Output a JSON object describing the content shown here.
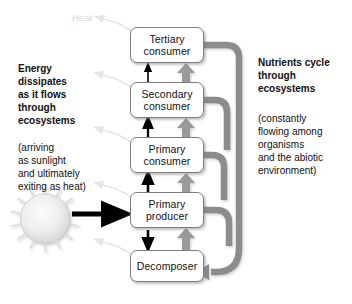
{
  "diagram": {
    "heat_label": "Heat",
    "colors": {
      "energy_arrow": "#000000",
      "nutrient_arrow": "#8c8c8c",
      "nutrient_pipe": "#8c8c8c",
      "heat_arrow": "#e2e2e2",
      "box_border": "#7d7d7d",
      "box_fill": "#ffffff",
      "sun_fill": "#ededed",
      "text": "#111111",
      "heat_label_color": "#d7d7d7"
    },
    "left_column": {
      "heading": "Energy\ndissipates\nas it flows\nthrough\necosystems",
      "note": "(arriving\nas sunlight\nand ultimately\nexiting as heat)"
    },
    "right_column": {
      "heading": "Nutrients cycle\nthrough\necosystems",
      "note": "(constantly\nflowing among\norganisms\nand the abiotic\nenvironment)"
    },
    "boxes": [
      {
        "id": "tertiary",
        "line1": "Tertiary",
        "line2": "consumer"
      },
      {
        "id": "secondary",
        "line1": "Secondary",
        "line2": "consumer"
      },
      {
        "id": "primary_consumer",
        "line1": "Primary",
        "line2": "consumer"
      },
      {
        "id": "primary_producer",
        "line1": "Primary",
        "line2": "producer"
      },
      {
        "id": "decomposer",
        "line1": "Decomposer",
        "line2": ""
      }
    ]
  }
}
